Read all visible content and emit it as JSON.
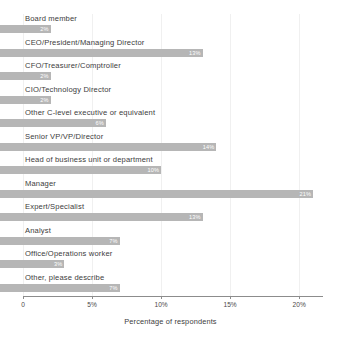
{
  "chart_data": {
    "type": "bar",
    "orientation": "horizontal",
    "title": "",
    "xlabel": "Percentage of respondents",
    "ylabel": "",
    "xlim": [
      0,
      21
    ],
    "grid": true,
    "legend": false,
    "xticks": [
      "0",
      "5%",
      "10%",
      "15%",
      "20%"
    ],
    "xtick_values": [
      0,
      5,
      10,
      15,
      20
    ],
    "bar_color": "#b6b6b6",
    "categories": [
      "Board member",
      "CEO/President/Managing Director",
      "CFO/Treasurer/Comptroller",
      "CIO/Technology Director",
      "Other C-level executive or equivalent",
      "Senior VP/VP/Director",
      "Head of business unit or department",
      "Manager",
      "Expert/Specialist",
      "Analyst",
      "Office/Operations worker",
      "Other, please describe"
    ],
    "values": [
      2,
      13,
      2,
      2,
      6,
      14,
      10,
      21,
      13,
      7,
      3,
      7
    ],
    "value_labels": [
      "2%",
      "13%",
      "2%",
      "2%",
      "6%",
      "14%",
      "10%",
      "21%",
      "13%",
      "7%",
      "3%",
      "7%"
    ]
  }
}
